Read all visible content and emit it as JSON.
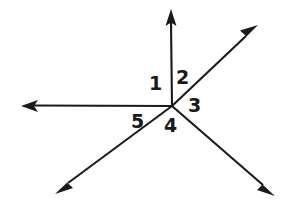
{
  "figure": {
    "name": "five-numbered-angles-at-a-point",
    "background_color": "#ffffff",
    "stroke_color": "#1a1a1a",
    "stroke_width": 2.1,
    "width": 286,
    "height": 208,
    "vertex": {
      "x": 172,
      "y": 106
    },
    "rays": [
      {
        "id": "ray-up",
        "name": "vertical-up-ray",
        "tip": {
          "x": 171,
          "y": 9
        },
        "direction_deg": 90,
        "arrow": true
      },
      {
        "id": "ray-upper-right",
        "name": "upper-right-diagonal-ray",
        "tip": {
          "x": 258,
          "y": 25
        },
        "direction_deg": 43,
        "arrow": true
      },
      {
        "id": "ray-lower-right",
        "name": "lower-right-diagonal-ray",
        "tip": {
          "x": 275,
          "y": 196
        },
        "direction_deg": -41,
        "arrow": true
      },
      {
        "id": "ray-lower-left",
        "name": "lower-left-diagonal-ray",
        "tip": {
          "x": 55,
          "y": 194
        },
        "direction_deg": -143,
        "arrow": true
      },
      {
        "id": "ray-left",
        "name": "horizontal-left-ray",
        "tip": {
          "x": 21,
          "y": 106
        },
        "direction_deg": 180,
        "arrow": true
      }
    ],
    "labels": [
      {
        "id": "label-1",
        "text": "1",
        "x": 149,
        "y": 74,
        "between": [
          "ray-left",
          "ray-up"
        ]
      },
      {
        "id": "label-2",
        "text": "2",
        "x": 176,
        "y": 68,
        "between": [
          "ray-up",
          "ray-upper-right"
        ]
      },
      {
        "id": "label-3",
        "text": "3",
        "x": 188,
        "y": 96,
        "between": [
          "ray-upper-right",
          "ray-lower-right"
        ]
      },
      {
        "id": "label-4",
        "text": "4",
        "x": 164,
        "y": 116,
        "between": [
          "ray-lower-right",
          "ray-lower-left"
        ]
      },
      {
        "id": "label-5",
        "text": "5",
        "x": 131,
        "y": 112,
        "between": [
          "ray-lower-left",
          "ray-left"
        ]
      }
    ]
  }
}
